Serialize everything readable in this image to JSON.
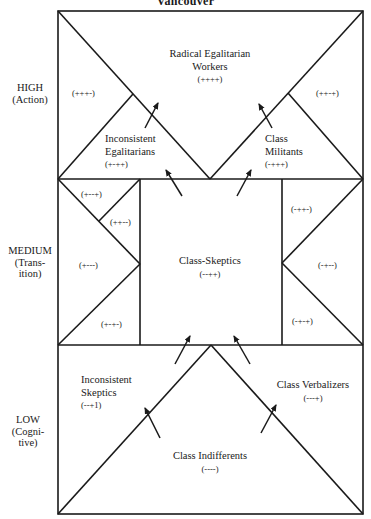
{
  "title": "Vancouver",
  "levels": [
    {
      "name": "HIGH",
      "sub": "(Action)"
    },
    {
      "name": "MEDIUM",
      "sub1": "(Trans-",
      "sub2": "ition)"
    },
    {
      "name": "LOW",
      "sub1": "(Cogni-",
      "sub2": "tive)"
    }
  ],
  "groups": {
    "radical_egalitarian_workers": {
      "line1": "Radical Egalitarian",
      "line2": "Workers",
      "code": "(++++)"
    },
    "inconsistent_egalitarians": {
      "line1": "Inconsistent",
      "line2": "Egalitarians",
      "code": "(+-++)"
    },
    "class_militants": {
      "line1": "Class",
      "line2": "Militants",
      "code": "(-+++)"
    },
    "class_skeptics": {
      "line1": "Class-Skeptics",
      "code": "(--++)"
    },
    "inconsistent_skeptics": {
      "line1": "Inconsistent",
      "line2": "Skeptics",
      "code": "(--+1)"
    },
    "class_verbalizers": {
      "line1": "Class Verbalizers",
      "code": "(---+)"
    },
    "class_indifferents": {
      "line1": "Class Indifferents",
      "code": "(----)"
    }
  },
  "codes": {
    "high_left": "(+++-)",
    "high_right": "(++-+)",
    "med_left_top": "(+--+)",
    "med_left_upper_mid": "(++--)",
    "med_left_mid": "(+---)",
    "med_left_bottom": "(+-+-)",
    "med_right_top": "(-++-)",
    "med_right_mid": "(-+--)",
    "med_right_bottom": "(-+-+)"
  },
  "colors": {
    "line": "#1a1a1a",
    "background": "#ffffff"
  }
}
